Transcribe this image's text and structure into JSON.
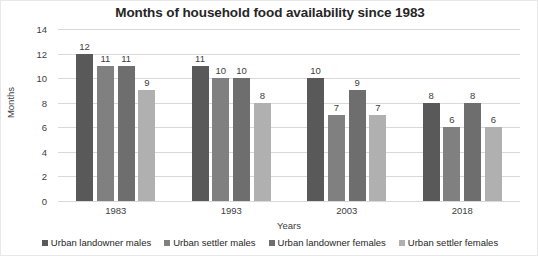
{
  "chart_data": {
    "type": "bar",
    "title": "Months of household food availability since 1983",
    "xlabel": "Years",
    "ylabel": "Months",
    "categories": [
      "1983",
      "1993",
      "2003",
      "2018"
    ],
    "series": [
      {
        "name": "Urban landowner males",
        "color": "#595959",
        "values": [
          12,
          11,
          10,
          8
        ]
      },
      {
        "name": "Urban settler males",
        "color": "#808080",
        "values": [
          11,
          10,
          7,
          6
        ]
      },
      {
        "name": "Urban landowner females",
        "color": "#6e6e6e",
        "values": [
          11,
          10,
          9,
          8
        ]
      },
      {
        "name": "Urban settler females",
        "color": "#b0b0b0",
        "values": [
          9,
          8,
          7,
          6
        ]
      }
    ],
    "ylim": [
      0,
      14
    ],
    "yticks": [
      0,
      2,
      4,
      6,
      8,
      10,
      12,
      14
    ],
    "grid": true,
    "legend_position": "bottom",
    "data_labels": true
  }
}
